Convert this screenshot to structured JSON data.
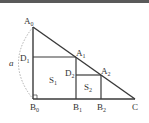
{
  "figure": {
    "points": {
      "A0": {
        "label": "A",
        "sub": "0"
      },
      "A1": {
        "label": "A",
        "sub": "1"
      },
      "A2": {
        "label": "A",
        "sub": "2"
      },
      "B0": {
        "label": "B",
        "sub": "0"
      },
      "B1": {
        "label": "B",
        "sub": "1"
      },
      "B2": {
        "label": "B",
        "sub": "2"
      },
      "C": {
        "label": "C"
      },
      "D1": {
        "label": "D",
        "sub": "1"
      },
      "D2": {
        "label": "D",
        "sub": "2"
      }
    },
    "areas": {
      "S1": {
        "label": "S",
        "sub": "1"
      },
      "S2": {
        "label": "S",
        "sub": "2"
      }
    },
    "side_label": "a",
    "colors": {
      "line": "#3a3a3a",
      "dashed_arc": "#999999",
      "top_border": "#555555",
      "text": "#333333"
    }
  }
}
